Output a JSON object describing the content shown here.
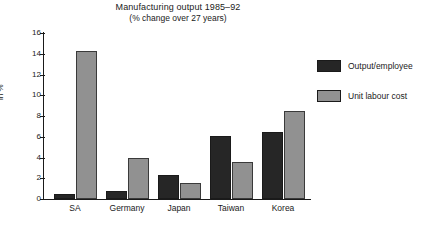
{
  "chart_data": {
    "type": "bar",
    "title": "Manufacturing output 1985–92",
    "subtitle": "(% change over 27 years)",
    "xlabel": "",
    "ylabel": "in %",
    "ylim": [
      0,
      16
    ],
    "ytick_step": 2,
    "yticks": [
      16,
      14,
      12,
      10,
      8,
      6,
      4,
      2,
      0
    ],
    "ytick_labels": [
      "16",
      "14",
      "12",
      "10",
      "8",
      "6",
      "4",
      "2",
      "0"
    ],
    "grid": false,
    "legend_position": "right",
    "categories": [
      "SA",
      "Germany",
      "Japan",
      "Taiwan",
      "Korea"
    ],
    "series": [
      {
        "name": "Output/employee",
        "color": "#262626",
        "values": [
          0.5,
          0.8,
          2.3,
          6.1,
          6.5
        ]
      },
      {
        "name": "Unit labour cost",
        "color": "#919191",
        "values": [
          14.3,
          4.0,
          1.5,
          3.6,
          8.5
        ]
      }
    ]
  },
  "colors": {
    "background": "#ffffff",
    "axis": "#1a1a1a",
    "series_dark": "#262626",
    "series_gray": "#919191"
  }
}
